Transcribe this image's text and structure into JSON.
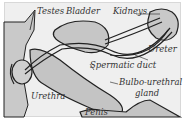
{
  "diagram": {
    "labels": {
      "testes": "Testes",
      "bladder": "Bladder",
      "kidneys": "Kidneys",
      "ureter": "Ureter",
      "spermatic_duct": "Spermatic duct",
      "bulbo_urethral_gland_line1": "Bulbo-urethral",
      "bulbo_urethral_gland_line2": "gland",
      "urethra": "Urethra",
      "penis": "Penis"
    },
    "colors": {
      "background": "#efefef",
      "organ_fill": "#c8c8c8",
      "outline": "#222222",
      "text": "#333333"
    }
  }
}
